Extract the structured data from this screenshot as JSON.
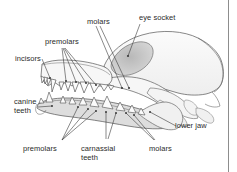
{
  "figure": {
    "background_color": "#ffffff",
    "line_color": "#4a4a4a",
    "text_color": "#2b2b2b",
    "bone_fill": "#f2f2f2",
    "shade_fill": "#d9d9d9",
    "border_color": "#8d8d8d"
  },
  "labels": {
    "molars_top": "molars",
    "eye_socket": "eye socket",
    "premolars_top": "premolars",
    "incisors": "incisors",
    "canine_teeth_line1": "canine",
    "canine_teeth_line2": "teeth",
    "premolars_bottom": "premolars",
    "carnassial_line1": "carnassial",
    "carnassial_line2": "teeth",
    "molars_bottom": "molars",
    "lower_jaw": "lower jaw"
  }
}
